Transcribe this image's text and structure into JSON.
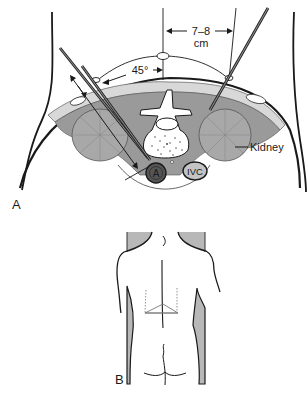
{
  "figure": {
    "panel_a": {
      "label": "A",
      "distance_label_line1": "7–8",
      "distance_label_line2": "cm",
      "angle_label": "45°",
      "kidney_label": "Kidney",
      "aorta_label": "A",
      "ivc_label": "IVC"
    },
    "panel_b": {
      "label": "B"
    }
  },
  "colors": {
    "ink": "#1a1a1a",
    "muscle_fill": "#9a9a9a",
    "kidney_fill": "#a8a8a8",
    "shade_fill": "#b8b8b8",
    "aorta_fill": "#555555",
    "needle": "#6a6a6a"
  }
}
